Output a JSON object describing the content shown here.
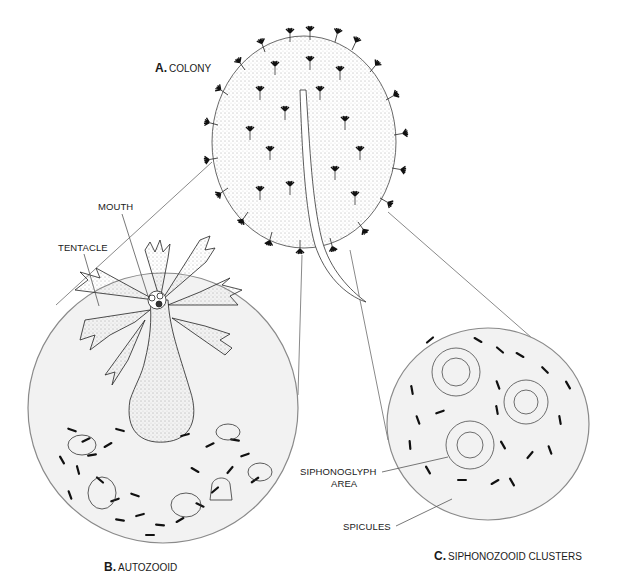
{
  "figure": {
    "panels": [
      {
        "letter": "A.",
        "name": "COLONY"
      },
      {
        "letter": "B.",
        "name": "AUTOZOOID"
      },
      {
        "letter": "C.",
        "name": "SIPHONOZOOID CLUSTERS"
      }
    ],
    "callouts": {
      "mouth": "MOUTH",
      "tentacle": "TENTACLE",
      "siphonoglyph_line1": "SIPHONOGLYPH",
      "siphonoglyph_line2": "AREA",
      "spicules": "SPICULES"
    },
    "colors": {
      "ink": "#1a1a1a",
      "circle_fill": "#f2f2f2",
      "circle_stroke": "#8a8a8a",
      "leader": "#555555"
    }
  }
}
